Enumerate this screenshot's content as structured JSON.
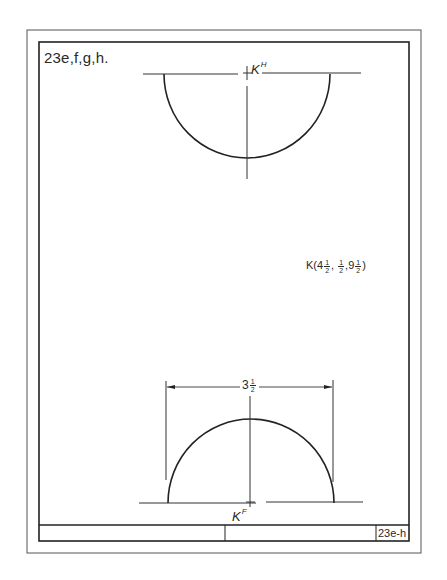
{
  "drawing": {
    "problem_id": "23e,f,g,h.",
    "title_block_number": "23e-h",
    "top_view_point_label": "K",
    "top_view_point_superscript": "H",
    "front_view_point_label": "K",
    "front_view_point_superscript": "F",
    "coordinate_point": {
      "name": "K",
      "x_whole": "4",
      "x_num": "1",
      "x_den": "2",
      "y_num": "1",
      "y_den": "2",
      "z_whole": "9",
      "z_num": "1",
      "z_den": "2"
    },
    "dimension": {
      "whole": "3",
      "num": "1",
      "den": "2"
    },
    "line_color": "#2a2a2a"
  }
}
